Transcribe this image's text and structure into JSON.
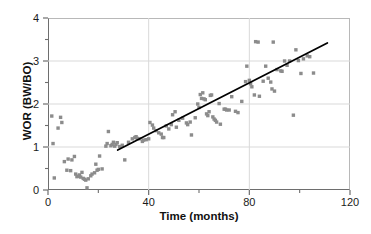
{
  "chart_data": {
    "type": "scatter",
    "title": "",
    "xlabel": "Time (months)",
    "ylabel": "WOR (BW/BO)",
    "xlim": [
      0,
      120
    ],
    "ylim": [
      0,
      4
    ],
    "grid": true,
    "grid_axes": "both",
    "legend": "none",
    "marker_color": "#8c8c8c",
    "marker_shape": "square",
    "line_color": "#000000",
    "axis_color": "#6e6e6e",
    "grid_color": "#d9d9d9",
    "x_major_ticks": [
      0,
      40,
      80,
      120
    ],
    "x_minor_ticks": [
      20,
      60,
      100
    ],
    "x_tick_labels": [
      "0",
      "40",
      "80",
      "120"
    ],
    "y_major_ticks": [
      0,
      1,
      2,
      3,
      4
    ],
    "y_minor_ticks": [
      0.5,
      1.5,
      2.5,
      3.5
    ],
    "y_tick_labels": [
      "0",
      "1",
      "2",
      "3",
      "4"
    ],
    "series": [
      {
        "name": "WOR data",
        "type": "scatter",
        "points": [
          [
            1.5,
            1.72
          ],
          [
            2.0,
            1.08
          ],
          [
            2.5,
            0.28
          ],
          [
            4.0,
            1.44
          ],
          [
            5.0,
            1.69
          ],
          [
            5.5,
            1.57
          ],
          [
            6.5,
            0.66
          ],
          [
            7.5,
            0.46
          ],
          [
            8.0,
            0.72
          ],
          [
            9.0,
            0.45
          ],
          [
            9.5,
            0.7
          ],
          [
            10.5,
            0.78
          ],
          [
            11.0,
            0.37
          ],
          [
            11.5,
            0.31
          ],
          [
            12.0,
            0.32
          ],
          [
            12.5,
            0.35
          ],
          [
            13.0,
            0.3
          ],
          [
            13.5,
            0.41
          ],
          [
            14.0,
            0.27
          ],
          [
            14.5,
            0.25
          ],
          [
            15.0,
            0.23
          ],
          [
            15.5,
            0.05
          ],
          [
            16.0,
            0.26
          ],
          [
            17.0,
            0.33
          ],
          [
            17.5,
            0.37
          ],
          [
            18.5,
            0.4
          ],
          [
            19.0,
            0.6
          ],
          [
            19.5,
            0.46
          ],
          [
            20.0,
            0.48
          ],
          [
            20.5,
            0.79
          ],
          [
            21.5,
            0.49
          ],
          [
            23.0,
            1.02
          ],
          [
            23.5,
            1.08
          ],
          [
            24.0,
            1.36
          ],
          [
            25.0,
            1.03
          ],
          [
            25.5,
            1.06
          ],
          [
            26.0,
            1.11
          ],
          [
            26.5,
            1.02
          ],
          [
            27.0,
            1.06
          ],
          [
            27.5,
            1.1
          ],
          [
            28.5,
            1.01
          ],
          [
            29.5,
            1.04
          ],
          [
            30.5,
            0.7
          ],
          [
            32.0,
            1.11
          ],
          [
            33.5,
            1.19
          ],
          [
            34.5,
            1.22
          ],
          [
            35.0,
            1.24
          ],
          [
            35.5,
            1.2
          ],
          [
            36.5,
            1.19
          ],
          [
            37.5,
            1.13
          ],
          [
            38.0,
            1.16
          ],
          [
            39.0,
            1.17
          ],
          [
            40.0,
            1.19
          ],
          [
            40.5,
            1.57
          ],
          [
            41.5,
            1.51
          ],
          [
            42.0,
            1.44
          ],
          [
            43.0,
            1.38
          ],
          [
            44.0,
            1.33
          ],
          [
            45.0,
            1.3
          ],
          [
            45.5,
            1.22
          ],
          [
            46.0,
            1.22
          ],
          [
            47.0,
            1.49
          ],
          [
            48.0,
            1.42
          ],
          [
            49.0,
            1.52
          ],
          [
            49.5,
            1.75
          ],
          [
            50.5,
            1.82
          ],
          [
            51.0,
            1.46
          ],
          [
            52.0,
            1.62
          ],
          [
            53.5,
            1.67
          ],
          [
            55.0,
            1.56
          ],
          [
            55.5,
            1.52
          ],
          [
            56.5,
            1.58
          ],
          [
            57.0,
            1.28
          ],
          [
            58.5,
            1.68
          ],
          [
            59.5,
            2.0
          ],
          [
            60.0,
            1.92
          ],
          [
            60.5,
            2.22
          ],
          [
            61.0,
            2.13
          ],
          [
            61.5,
            2.26
          ],
          [
            62.0,
            2.12
          ],
          [
            62.5,
            2.1
          ],
          [
            63.0,
            1.77
          ],
          [
            63.5,
            1.73
          ],
          [
            64.0,
            1.82
          ],
          [
            64.5,
            2.2
          ],
          [
            65.0,
            2.21
          ],
          [
            65.5,
            1.7
          ],
          [
            66.0,
            1.65
          ],
          [
            66.5,
            1.62
          ],
          [
            67.0,
            1.58
          ],
          [
            68.0,
            2.01
          ],
          [
            68.5,
            1.53
          ],
          [
            70.0,
            1.88
          ],
          [
            70.5,
            1.88
          ],
          [
            71.0,
            1.86
          ],
          [
            72.0,
            1.86
          ],
          [
            73.0,
            2.17
          ],
          [
            74.5,
            1.83
          ],
          [
            75.5,
            1.8
          ],
          [
            77.0,
            2.06
          ],
          [
            78.5,
            2.52
          ],
          [
            79.0,
            2.88
          ],
          [
            80.0,
            2.55
          ],
          [
            80.5,
            2.47
          ],
          [
            81.0,
            2.4
          ],
          [
            82.0,
            2.21
          ],
          [
            82.5,
            3.45
          ],
          [
            83.5,
            3.44
          ],
          [
            84.0,
            2.18
          ],
          [
            85.5,
            2.53
          ],
          [
            86.5,
            2.88
          ],
          [
            87.5,
            2.6
          ],
          [
            88.5,
            2.51
          ],
          [
            89.0,
            2.35
          ],
          [
            89.5,
            3.44
          ],
          [
            90.0,
            2.3
          ],
          [
            91.0,
            2.8
          ],
          [
            92.5,
            2.77
          ],
          [
            93.0,
            2.76
          ],
          [
            94.0,
            3.0
          ],
          [
            95.0,
            2.9
          ],
          [
            96.0,
            3.0
          ],
          [
            97.5,
            1.74
          ],
          [
            98.5,
            3.26
          ],
          [
            99.5,
            3.01
          ],
          [
            100.5,
            2.71
          ],
          [
            101.5,
            3.05
          ],
          [
            103.0,
            3.12
          ],
          [
            104.0,
            3.1
          ],
          [
            105.5,
            2.72
          ]
        ]
      },
      {
        "name": "Linear trend",
        "type": "line",
        "points": [
          [
            27.7,
            0.93
          ],
          [
            111.0,
            3.42
          ]
        ]
      }
    ]
  },
  "axes": {
    "x": {
      "title": "Time (months)",
      "labels": [
        "0",
        "40",
        "80",
        "120"
      ]
    },
    "y": {
      "title": "WOR (BW/BO)",
      "labels": [
        "0",
        "1",
        "2",
        "3",
        "4"
      ]
    }
  }
}
